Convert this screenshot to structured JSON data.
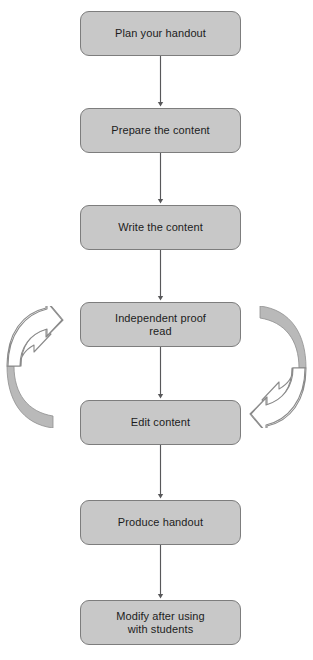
{
  "diagram": {
    "type": "flowchart",
    "orientation": "vertical",
    "background_color": "#ffffff",
    "node_fill_color": "#c8c8c8",
    "node_border_color": "#7d7d7d",
    "node_text_color": "#1c1c1c",
    "connector_color": "#58585a",
    "curve_outline_color": "#8a8a8a",
    "curve_fill_color": "#ffffff",
    "curve_shadow_color": "#b7b7b7",
    "nodes": [
      {
        "id": "plan",
        "label": "Plan your handout",
        "lines": [
          "Plan your handout"
        ],
        "x": 80,
        "y": 11,
        "width": 161,
        "height": 45
      },
      {
        "id": "prepare",
        "label": "Prepare the content",
        "lines": [
          "Prepare the content"
        ],
        "x": 80,
        "y": 108,
        "width": 161,
        "height": 45
      },
      {
        "id": "write",
        "label": "Write the content",
        "lines": [
          "Write the content"
        ],
        "x": 80,
        "y": 205,
        "width": 161,
        "height": 45
      },
      {
        "id": "proof",
        "label": "Independent proof read",
        "lines": [
          "Independent proof",
          "read"
        ],
        "x": 80,
        "y": 302,
        "width": 161,
        "height": 45
      },
      {
        "id": "edit",
        "label": "Edit content",
        "lines": [
          "Edit content"
        ],
        "x": 80,
        "y": 400,
        "width": 161,
        "height": 45
      },
      {
        "id": "produce",
        "label": "Produce handout",
        "lines": [
          "Produce handout"
        ],
        "x": 80,
        "y": 500,
        "width": 161,
        "height": 45
      },
      {
        "id": "modify",
        "label": "Modify after using with students",
        "lines": [
          "Modify after using",
          "with students"
        ],
        "x": 80,
        "y": 600,
        "width": 161,
        "height": 45
      }
    ],
    "connectors": [
      {
        "from": "plan",
        "to": "prepare",
        "kind": "arrow-down"
      },
      {
        "from": "prepare",
        "to": "write",
        "kind": "arrow-down"
      },
      {
        "from": "write",
        "to": "proof",
        "kind": "arrow-down"
      },
      {
        "from": "proof",
        "to": "edit",
        "kind": "arrow-down"
      },
      {
        "from": "edit",
        "to": "produce",
        "kind": "arrow-down"
      },
      {
        "from": "produce",
        "to": "modify",
        "kind": "arrow-down"
      }
    ],
    "curved_arrows": [
      {
        "id": "left-curve",
        "name": "left-curved-arrow",
        "direction": "up-right",
        "x": 6,
        "y": 306,
        "width": 58,
        "height": 122
      },
      {
        "id": "right-curve",
        "name": "right-curved-arrow",
        "direction": "down-left",
        "x": 249,
        "y": 306,
        "width": 58,
        "height": 122
      }
    ]
  },
  "nodes_text": {
    "plan": {
      "line1": "Plan your handout",
      "line2": ""
    },
    "prepare": {
      "line1": "Prepare the content",
      "line2": ""
    },
    "write": {
      "line1": "Write the content",
      "line2": ""
    },
    "proof": {
      "line1": "Independent proof",
      "line2": "read"
    },
    "edit": {
      "line1": "Edit content",
      "line2": ""
    },
    "produce": {
      "line1": "Produce handout",
      "line2": ""
    },
    "modify": {
      "line1": "Modify after using",
      "line2": "with students"
    }
  }
}
